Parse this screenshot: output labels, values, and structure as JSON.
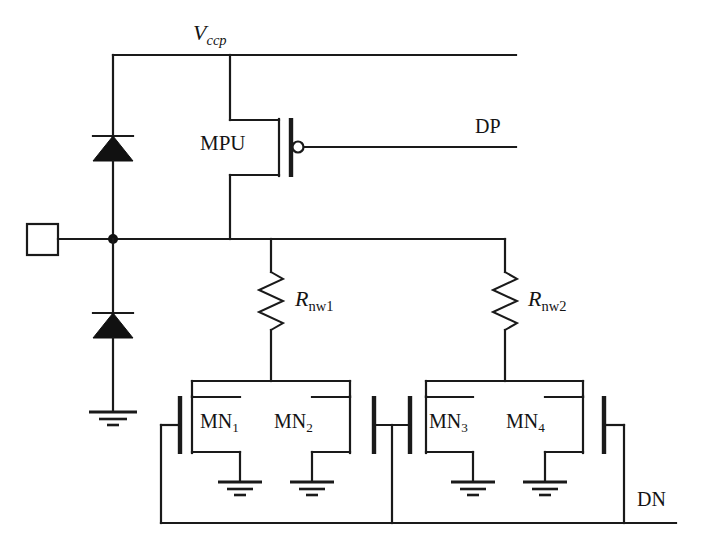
{
  "figure": {
    "kind": "circuit-schematic",
    "background_color": "#ffffff",
    "line_color": "#1a1a1a"
  },
  "labels": {
    "vccp": "V",
    "vccp_sub": "ccp",
    "mpu": "MPU",
    "dp": "DP",
    "rnw1": "R",
    "rnw1_sub": "nw1",
    "rnw2": "R",
    "rnw2_sub": "nw2",
    "mn1": "MN",
    "mn1_sub": "1",
    "mn2": "MN",
    "mn2_sub": "2",
    "mn3": "MN",
    "mn3_sub": "3",
    "mn4": "MN",
    "mn4_sub": "4",
    "dn": "DN"
  },
  "nodes": [
    {
      "name": "vccp-rail",
      "label": "Vccp"
    },
    {
      "name": "io-pad",
      "label": ""
    },
    {
      "name": "center-node",
      "label": ""
    },
    {
      "name": "dp-gate-net",
      "label": "DP"
    },
    {
      "name": "dn-gate-net",
      "label": "DN"
    },
    {
      "name": "ground",
      "label": ""
    }
  ],
  "components": [
    {
      "name": "diode-upper",
      "type": "diode",
      "label": "",
      "orientation": "up"
    },
    {
      "name": "diode-lower",
      "type": "diode",
      "label": "",
      "orientation": "up"
    },
    {
      "name": "pmos-mpu",
      "type": "pmos",
      "label": "MPU",
      "gate_net": "DP"
    },
    {
      "name": "resistor-rnw1",
      "type": "resistor",
      "label": "Rnw1"
    },
    {
      "name": "resistor-rnw2",
      "type": "resistor",
      "label": "Rnw2"
    },
    {
      "name": "nmos-mn1",
      "type": "nmos",
      "label": "MN1",
      "gate_net": "DN"
    },
    {
      "name": "nmos-mn2",
      "type": "nmos",
      "label": "MN2",
      "gate_net": "DN"
    },
    {
      "name": "nmos-mn3",
      "type": "nmos",
      "label": "MN3",
      "gate_net": "DN"
    },
    {
      "name": "nmos-mn4",
      "type": "nmos",
      "label": "MN4",
      "gate_net": "DN"
    },
    {
      "name": "io-pad-square",
      "type": "pad",
      "label": ""
    },
    {
      "name": "ground-symbol-main",
      "type": "ground",
      "label": ""
    },
    {
      "name": "ground-symbol-mn1",
      "type": "ground",
      "label": ""
    },
    {
      "name": "ground-symbol-mn2",
      "type": "ground",
      "label": ""
    },
    {
      "name": "ground-symbol-mn3",
      "type": "ground",
      "label": ""
    },
    {
      "name": "ground-symbol-mn4",
      "type": "ground",
      "label": ""
    }
  ]
}
